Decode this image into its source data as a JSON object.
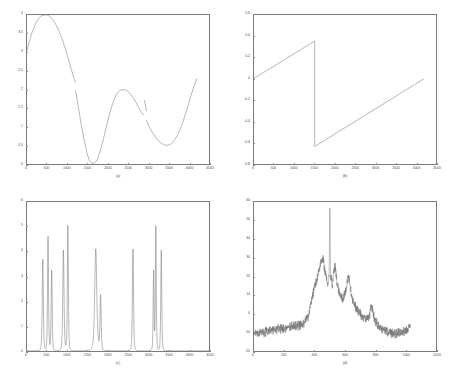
{
  "figure": {
    "background": "#ffffff",
    "line_color": "#6e6e6e",
    "axis_color": "#7a7a7a",
    "tick_text_color": "#4d4d4d"
  },
  "chart_data": [
    {
      "type": "line",
      "panel": "a",
      "caption": "(a)",
      "title": "",
      "xlabel": "",
      "ylabel": "",
      "xlim": [
        0,
        4500
      ],
      "ylim": [
        0,
        4
      ],
      "grid": false,
      "legend": null,
      "xticks": [
        0,
        500,
        1000,
        1500,
        2000,
        2500,
        3000,
        3500,
        4000,
        4500
      ],
      "xticklabels": [
        "0",
        "500",
        "1000",
        "1500",
        "2000",
        "2500",
        "3000",
        "3500",
        "4000",
        "4500"
      ],
      "yticks": [
        0,
        0.5,
        1,
        1.5,
        2,
        2.5,
        3,
        3.5,
        4
      ],
      "yticklabels": [
        "0",
        "0.5",
        "1",
        "1.5",
        "2",
        "2.5",
        "3",
        "3.5",
        "4"
      ],
      "series": [
        {
          "name": "instantaneous frequency",
          "x": [
            0,
            60,
            120,
            200,
            280,
            360,
            440,
            500,
            560,
            620,
            700,
            780,
            860,
            940,
            1020,
            1100,
            1160,
            1200,
            1200,
            1260,
            1320,
            1400,
            1480,
            1540,
            1600,
            1660,
            1740,
            1820,
            1900,
            1980,
            2060,
            2140,
            2220,
            2300,
            2380,
            2460,
            2540,
            2600,
            2660,
            2740,
            2820,
            2880,
            2900,
            2900,
            2920,
            2940,
            2950,
            2950,
            3000,
            3060,
            3140,
            3220,
            3300,
            3380,
            3460,
            3540,
            3600,
            3660,
            3740,
            3820,
            3900,
            3980,
            4060,
            4140,
            4200
          ],
          "y": [
            3.05,
            3.3,
            3.52,
            3.74,
            3.9,
            3.98,
            4.0,
            4.0,
            3.97,
            3.9,
            3.77,
            3.6,
            3.38,
            3.12,
            2.83,
            2.52,
            2.3,
            2.18,
            1.98,
            1.6,
            1.2,
            0.72,
            0.3,
            0.1,
            0.02,
            0.02,
            0.12,
            0.38,
            0.72,
            1.08,
            1.42,
            1.7,
            1.88,
            1.98,
            2.0,
            1.98,
            1.9,
            1.82,
            1.72,
            1.56,
            1.4,
            1.32,
            1.3,
            1.72,
            1.62,
            1.5,
            1.42,
            1.18,
            1.05,
            0.92,
            0.78,
            0.66,
            0.58,
            0.52,
            0.5,
            0.52,
            0.58,
            0.66,
            0.82,
            1.02,
            1.28,
            1.56,
            1.86,
            2.12,
            2.3
          ]
        }
      ]
    },
    {
      "type": "line",
      "panel": "b",
      "caption": "(b)",
      "title": "",
      "xlabel": "",
      "ylabel": "",
      "xlim": [
        0,
        4500
      ],
      "ylim": [
        -0.8,
        0.6
      ],
      "grid": false,
      "legend": null,
      "xticks": [
        0,
        500,
        1000,
        1500,
        2000,
        2500,
        3000,
        3500,
        4000,
        4500
      ],
      "xticklabels": [
        "0",
        "500",
        "1000",
        "1500",
        "2000",
        "2500",
        "3000",
        "3500",
        "4000",
        "4500"
      ],
      "yticks": [
        -0.8,
        -0.6,
        -0.4,
        -0.2,
        0,
        0.2,
        0.4,
        0.6
      ],
      "yticklabels": [
        "-0.8",
        "-0.6",
        "-0.4",
        "-0.2",
        "0",
        "0.2",
        "0.4",
        "0.6"
      ],
      "series": [
        {
          "name": "unwrapped phase (sawtooth)",
          "x": [
            0,
            1500,
            1500,
            4200
          ],
          "y": [
            0.005,
            0.355,
            -0.635,
            0.0
          ]
        }
      ]
    },
    {
      "type": "line",
      "panel": "c",
      "caption": "(c)",
      "title": "",
      "xlabel": "",
      "ylabel": "",
      "xlim": [
        0,
        4500
      ],
      "ylim": [
        0,
        6
      ],
      "grid": false,
      "legend": null,
      "xticks": [
        0,
        500,
        1000,
        1500,
        2000,
        2500,
        3000,
        3500,
        4000,
        4500
      ],
      "xticklabels": [
        "0",
        "500",
        "1000",
        "1500",
        "2000",
        "2500",
        "3000",
        "3500",
        "4000",
        "4500"
      ],
      "yticks": [
        0,
        1,
        2,
        3,
        4,
        5,
        6
      ],
      "yticklabels": [
        "0",
        "1",
        "2",
        "3",
        "4",
        "5",
        "6"
      ],
      "series": [
        {
          "name": "spectral peaks",
          "peaks": [
            {
              "x": 390,
              "height": 3.7,
              "width": 18
            },
            {
              "x": 520,
              "height": 4.6,
              "width": 16
            },
            {
              "x": 610,
              "height": 3.25,
              "width": 16
            },
            {
              "x": 900,
              "height": 4.05,
              "width": 20
            },
            {
              "x": 1010,
              "height": 5.05,
              "width": 16
            },
            {
              "x": 1700,
              "height": 4.1,
              "width": 34
            },
            {
              "x": 1820,
              "height": 2.2,
              "width": 18
            },
            {
              "x": 2620,
              "height": 4.1,
              "width": 18
            },
            {
              "x": 3130,
              "height": 3.2,
              "width": 14
            },
            {
              "x": 3185,
              "height": 5.0,
              "width": 14
            },
            {
              "x": 3320,
              "height": 4.05,
              "width": 16
            }
          ]
        }
      ]
    },
    {
      "type": "line",
      "panel": "d",
      "caption": "(d)",
      "title": "",
      "xlabel": "",
      "ylabel": "",
      "xlim": [
        0,
        1200
      ],
      "ylim": [
        -20,
        60
      ],
      "grid": false,
      "legend": null,
      "xticks": [
        0,
        200,
        400,
        600,
        800,
        1000,
        1200
      ],
      "xticklabels": [
        "0",
        "200",
        "400",
        "600",
        "800",
        "1000",
        "1200"
      ],
      "yticks": [
        -20,
        -10,
        0,
        10,
        20,
        30,
        40,
        50,
        60
      ],
      "yticklabels": [
        "-20",
        "-10",
        "0",
        "10",
        "20",
        "30",
        "40",
        "50",
        "60"
      ],
      "series": [
        {
          "name": "noisy spectrum (dB)",
          "noise_amplitude": 3.2,
          "envelope_x": [
            0,
            40,
            80,
            120,
            160,
            200,
            240,
            280,
            320,
            355,
            380,
            400,
            420,
            440,
            455,
            470,
            485,
            495,
            500,
            505,
            515,
            525,
            535,
            545,
            560,
            575,
            590,
            605,
            620,
            630,
            640,
            655,
            680,
            710,
            740,
            760,
            775,
            790,
            810,
            840,
            880,
            920,
            960,
            1000,
            1030
          ],
          "envelope_y": [
            -10.5,
            -10.0,
            -9.5,
            -8.6,
            -8.0,
            -7.5,
            -6.8,
            -6.2,
            -5.6,
            -2.0,
            8.0,
            14.0,
            20.0,
            27.5,
            29.5,
            22.0,
            16.0,
            20.0,
            57.0,
            22.0,
            14.0,
            22.0,
            25.5,
            18.0,
            12.0,
            9.5,
            8.5,
            12.0,
            20.5,
            17.0,
            11.0,
            6.0,
            2.0,
            -1.0,
            -3.0,
            -2.0,
            4.5,
            -1.5,
            -5.5,
            -8.0,
            -9.5,
            -10.5,
            -10.0,
            -9.5,
            -7.0
          ],
          "spike": {
            "x": 500,
            "value": 57.0
          }
        }
      ]
    }
  ]
}
